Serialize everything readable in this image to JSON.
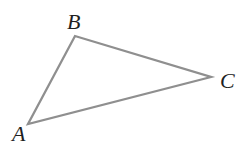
{
  "diagram": {
    "type": "triangle",
    "background": "#ffffff",
    "stroke_color": "#8f8f8f",
    "stroke_width": 2.3,
    "label_color": "#1f1f1f",
    "points": "28,124 75,36 211,77",
    "vertices": [
      {
        "label": "A",
        "x": 28,
        "y": 124,
        "label_x": 12,
        "label_y": 141
      },
      {
        "label": "B",
        "x": 75,
        "y": 36,
        "label_x": 67,
        "label_y": 29
      },
      {
        "label": "C",
        "x": 211,
        "y": 77,
        "label_x": 220,
        "label_y": 88
      }
    ]
  }
}
